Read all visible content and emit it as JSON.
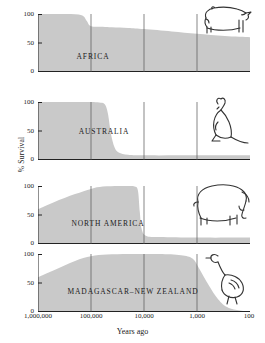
{
  "chart_data": {
    "type": "area",
    "title": "",
    "xlabel": "Years ago",
    "ylabel": "% Survival",
    "xscale": "log",
    "xlim": [
      1000000,
      100
    ],
    "ylim": [
      0,
      100
    ],
    "xticks": [
      1000000,
      100000,
      10000,
      1000,
      100
    ],
    "xticklabels": [
      "1,000,000",
      "100,000",
      "10,000",
      "1,000",
      "100"
    ],
    "yticks": [
      0,
      50,
      100
    ],
    "yticklabels": [
      "0",
      "50",
      "100"
    ],
    "grid": "vertical gridlines at 100,000 / 10,000 / 1,000 spanning all panels",
    "legend": "none",
    "panels": [
      {
        "name": "africa",
        "label": "AFRICA",
        "icon": "rhinoceros-icon",
        "note": "Gradual shallow decline; no mass extinction pulse",
        "x": [
          1000000,
          300000,
          150000,
          120000,
          100000,
          60000,
          40000,
          20000,
          10000,
          3000,
          1000,
          300,
          100
        ],
        "y": [
          100,
          100,
          98,
          88,
          79,
          78,
          77,
          76,
          74,
          70,
          66,
          62,
          60
        ]
      },
      {
        "name": "australia",
        "label": "AUSTRALIA",
        "icon": "kangaroo-icon",
        "note": "Abrupt collapse near 50,000-40,000 years ago",
        "x": [
          1000000,
          200000,
          100000,
          70000,
          55000,
          48000,
          42000,
          36000,
          30000,
          20000,
          10000,
          1000,
          100
        ],
        "y": [
          100,
          100,
          100,
          99,
          96,
          80,
          45,
          22,
          13,
          9,
          8,
          8,
          8
        ]
      },
      {
        "name": "north-america",
        "label": "NORTH AMERICA",
        "icon": "mammoth-icon",
        "note": "Abrupt collapse near 13,000-11,000 years ago",
        "x": [
          1000000,
          500000,
          200000,
          100000,
          60000,
          30000,
          20000,
          15000,
          13000,
          12000,
          11000,
          9000,
          5000,
          1000,
          100
        ],
        "y": [
          60,
          72,
          86,
          95,
          99,
          100,
          100,
          99,
          92,
          55,
          25,
          14,
          12,
          11,
          11
        ]
      },
      {
        "name": "madagascar-new-zealand",
        "label": "MADAGASCAR–NEW ZEALAND",
        "icon": "moa-icon",
        "note": "Latest collapse, near 1,000 years ago, reaching zero",
        "x": [
          1000000,
          500000,
          200000,
          100000,
          50000,
          20000,
          10000,
          5000,
          2000,
          1200,
          900,
          600,
          400,
          250,
          100
        ],
        "y": [
          60,
          72,
          88,
          96,
          99,
          100,
          100,
          100,
          98,
          92,
          74,
          46,
          22,
          7,
          0
        ]
      }
    ]
  },
  "axis": {
    "ylabel": "% Survival",
    "xlabel": "Years ago"
  }
}
